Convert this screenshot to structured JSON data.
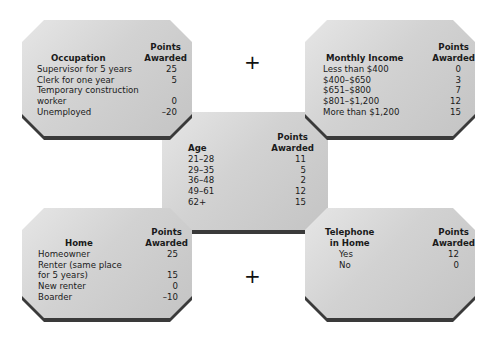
{
  "boxes": {
    "occupation": {
      "title": "Occupation",
      "points_header": "Points\nAwarded",
      "rows": [
        {
          "label": "Supervisor for 5 years",
          "points": "25"
        },
        {
          "label": "Clerk for one year",
          "points": "5"
        },
        {
          "label": "Temporary construction\n  worker",
          "points": "0"
        },
        {
          "label": "Unemployed",
          "points": "–20"
        }
      ]
    },
    "monthly_income": {
      "title": "Monthly Income",
      "points_header": "Points\nAwarded",
      "rows": [
        {
          "label": "Less than $400",
          "points": "0"
        },
        {
          "label": "$400–$650",
          "points": "3"
        },
        {
          "label": "$651–$800",
          "points": "7"
        },
        {
          "label": "$801–$1,200",
          "points": "12"
        },
        {
          "label": "More than $1,200",
          "points": "15"
        }
      ]
    },
    "age": {
      "title": "Age",
      "points_header": "Points\nAwarded",
      "rows": [
        {
          "label": "21–28",
          "points": "11"
        },
        {
          "label": "29–35",
          "points": "5"
        },
        {
          "label": "36–48",
          "points": "2"
        },
        {
          "label": "49–61",
          "points": "12"
        },
        {
          "label": "62+",
          "points": "15"
        }
      ]
    },
    "home": {
      "title": "Home",
      "points_header": "Points\nAwarded",
      "rows": [
        {
          "label": "Homeowner",
          "points": "25"
        },
        {
          "label": "Renter (same place\n  for 5 years)",
          "points": "15"
        },
        {
          "label": "New renter",
          "points": "0"
        },
        {
          "label": "Boarder",
          "points": "–10"
        }
      ]
    },
    "telephone": {
      "title": "Telephone\nin Home",
      "points_header": "Points\nAwarded",
      "rows": [
        {
          "label": "Yes",
          "points": "12"
        },
        {
          "label": "No",
          "points": "0"
        }
      ]
    }
  },
  "operators": {
    "top": "+",
    "bottom": "+"
  }
}
